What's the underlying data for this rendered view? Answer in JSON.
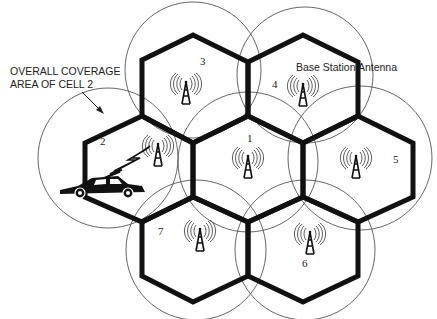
{
  "diagram": {
    "annotations": {
      "coverage_label_line1": "OVERALL COVERAGE",
      "coverage_label_line2": "AREA OF CELL 2",
      "antenna_label": "Base Station Antenna"
    },
    "cells": [
      {
        "id": "1",
        "label": "1"
      },
      {
        "id": "2",
        "label": "2"
      },
      {
        "id": "3",
        "label": "3"
      },
      {
        "id": "4",
        "label": "4"
      },
      {
        "id": "5",
        "label": "5"
      },
      {
        "id": "6",
        "label": "6"
      },
      {
        "id": "7",
        "label": "7"
      }
    ],
    "icons": {
      "antenna": "radio-tower-icon",
      "vehicle": "car-icon",
      "signal": "lightning-bolt-icon"
    },
    "colors": {
      "stroke": "#111111",
      "circle": "#555555",
      "background": "#ffffff"
    }
  }
}
